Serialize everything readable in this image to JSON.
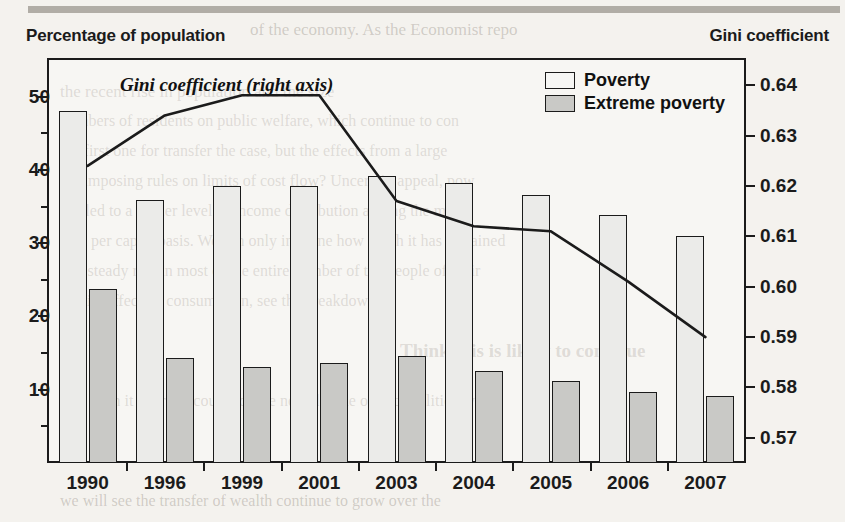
{
  "axis_titles": {
    "left": "Percentage of population",
    "right": "Gini coefficient"
  },
  "legend": {
    "poverty_label": "Poverty",
    "extreme_label": "Extreme poverty"
  },
  "line_annotation": "Gini coefficient (right axis)",
  "colors": {
    "poverty_fill": "#ebebe9",
    "extreme_fill": "#c9c9c6",
    "ink": "#1b1b1b",
    "page": "#f4f2ee"
  },
  "bleed_text": [
    "of the economy. As the Economist repo",
    "the recent rise in population and the size",
    "numbers of residents on public welfare, which continue to con",
    "the first one for transfer the case, but the effects from a large",
    "the imposing rules on limits of cost flow? Uncertain appeal, pow",
    "has led to a higher level of income distribution among the mem",
    "on a per capita basis. We can only imagine how much it has remained",
    "to a steady rate in most of the entire number of the people of their",
    "and its effect on consumption, see the breakdown.",
    "Think this is likely to continue",
    "will be in it over the course of the next decade or two. Politically",
    "we will see the transfer of wealth continue to grow over the"
  ],
  "chart_data": {
    "type": "bar",
    "title": "",
    "xlabel": "",
    "ylabel": "Percentage of population",
    "y2label": "Gini coefficient",
    "ylim": [
      0,
      55
    ],
    "y2lim": [
      0.565,
      0.645
    ],
    "yticks": [
      10,
      20,
      30,
      40,
      50
    ],
    "y2ticks": [
      "0.57",
      "0.58",
      "0.59",
      "0.60",
      "0.61",
      "0.62",
      "0.63",
      "0.64"
    ],
    "grid": false,
    "legend_position": "top-right",
    "categories": [
      "1990",
      "1996",
      "1999",
      "2001",
      "2003",
      "2004",
      "2005",
      "2006",
      "2007"
    ],
    "series": [
      {
        "name": "Poverty",
        "type": "bar",
        "axis": "left",
        "values": [
          48.0,
          35.9,
          37.8,
          37.8,
          39.2,
          38.2,
          36.6,
          33.9,
          31.0
        ]
      },
      {
        "name": "Extreme poverty",
        "type": "bar",
        "axis": "left",
        "values": [
          23.8,
          14.3,
          13.1,
          13.6,
          14.6,
          12.6,
          11.2,
          9.7,
          9.1
        ]
      },
      {
        "name": "Gini coefficient (right axis)",
        "type": "line",
        "axis": "right",
        "values": [
          0.624,
          0.634,
          0.638,
          0.638,
          0.617,
          0.612,
          0.611,
          0.601,
          0.59
        ]
      }
    ]
  }
}
